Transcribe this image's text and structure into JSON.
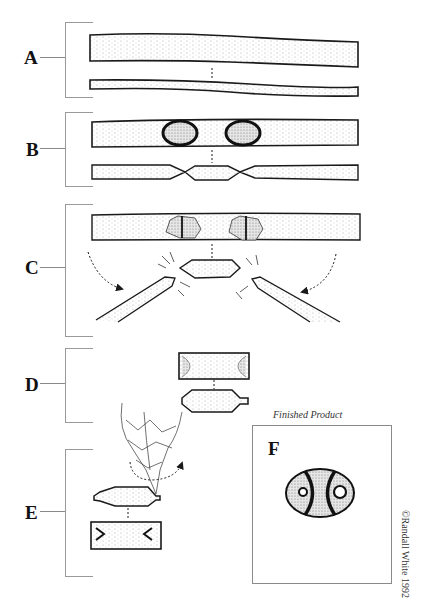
{
  "figure": {
    "steps": [
      {
        "label": "A",
        "description": "bone tube (two parallel cylinders)"
      },
      {
        "label": "B",
        "description": "tube scored in two places"
      },
      {
        "label": "C",
        "description": "scored segment snapped off"
      },
      {
        "label": "D",
        "description": "segment blank, top and side views"
      },
      {
        "label": "E",
        "description": "perforation with flint tool"
      },
      {
        "label": "F",
        "description": "finished bead"
      }
    ],
    "caption": "Finished Product",
    "copyright": "©Randall White 1992"
  },
  "colors": {
    "ink": "#1a1a1a",
    "stipple": "#8a8a8a",
    "bracket": "#9a9a9a",
    "background": "#ffffff"
  }
}
